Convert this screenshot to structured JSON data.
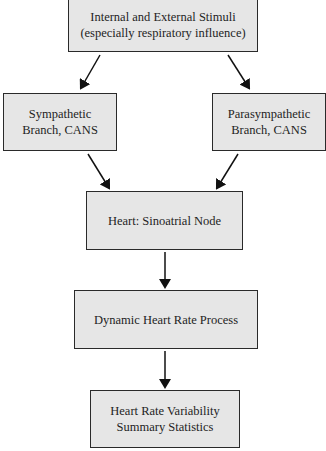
{
  "diagram": {
    "type": "flowchart",
    "nodes": [
      {
        "id": "stimuli",
        "label": "Internal and External Stimuli\n(especially respiratory influence)"
      },
      {
        "id": "sympathetic",
        "label": "Sympathetic\nBranch, CANS"
      },
      {
        "id": "parasympathetic",
        "label": "Parasympathetic\nBranch, CANS"
      },
      {
        "id": "sa_node",
        "label": "Heart: Sinoatrial Node"
      },
      {
        "id": "dynamic_hr",
        "label": "Dynamic Heart Rate Process"
      },
      {
        "id": "hrv_stats",
        "label": "Heart Rate Variability\nSummary Statistics"
      }
    ],
    "edges": [
      {
        "from": "stimuli",
        "to": "sympathetic"
      },
      {
        "from": "stimuli",
        "to": "parasympathetic"
      },
      {
        "from": "sympathetic",
        "to": "sa_node"
      },
      {
        "from": "parasympathetic",
        "to": "sa_node"
      },
      {
        "from": "sa_node",
        "to": "dynamic_hr"
      },
      {
        "from": "dynamic_hr",
        "to": "hrv_stats"
      }
    ],
    "colors": {
      "box_fill": "#e6e6e6",
      "box_border": "#2a2a2a",
      "arrow": "#111111"
    }
  }
}
